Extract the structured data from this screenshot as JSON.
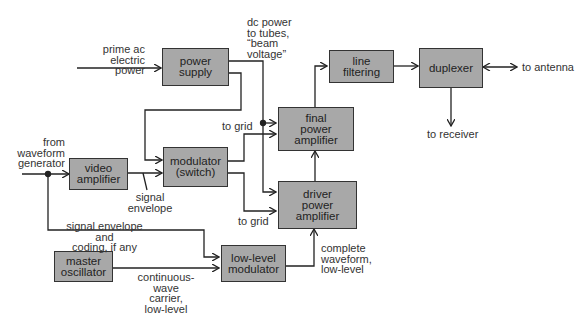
{
  "diagram": {
    "type": "radar transmitter block diagram",
    "blocks": {
      "power_supply": "power\nsupply",
      "video_amplifier": "video\namplifier",
      "modulator": "modulator\n(switch)",
      "final_amp": "final\npower\namplifier",
      "driver_amp": "driver\npower\namplifier",
      "line_filtering": "line\nfiltering",
      "duplexer": "duplexer",
      "master_oscillator": "master\noscillator",
      "low_level_modulator": "low-level\nmodulator"
    },
    "labels": {
      "prime_ac": "prime ac\nelectric power",
      "dc_power": "dc power\nto tubes,\n“beam\nvoltage”",
      "to_antenna": "to antenna",
      "to_receiver": "to receiver",
      "to_grid_top": "to grid",
      "to_grid_bottom": "to grid",
      "from_waveform": "from\nwaveform\ngenerator",
      "signal_envelope": "signal\nenvelope",
      "signal_envelope_coding": "signal envelope and\ncoding, if any",
      "cw_carrier": "continuous-wave\ncarrier,\nlow-level",
      "complete_waveform": "complete\nwaveform,\nlow-level"
    },
    "colors": {
      "box_fill": "#a8a8a8",
      "line": "#222222"
    }
  }
}
